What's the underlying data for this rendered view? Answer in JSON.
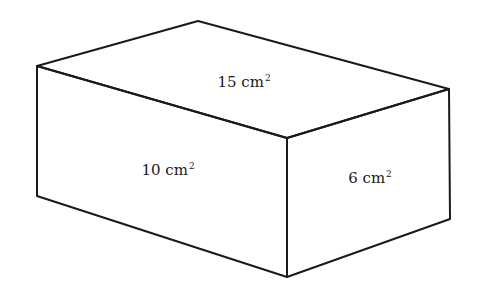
{
  "diagram": {
    "shape": "rectangular-prism",
    "stroke_color": "#1a1a1a",
    "background_color": "#ffffff",
    "vertices": {
      "top_back": [
        198,
        21
      ],
      "top_left": [
        37,
        66
      ],
      "top_right": [
        449,
        89
      ],
      "front_top": [
        287,
        138
      ],
      "bottom_left": [
        37,
        196
      ],
      "front_bottom": [
        287,
        277
      ],
      "bottom_right": [
        450,
        219
      ]
    },
    "faces": {
      "top": {
        "value": "15",
        "unit": "cm",
        "exponent": "2",
        "position": [
          244,
          82
        ]
      },
      "front": {
        "value": "10",
        "unit": "cm",
        "exponent": "2",
        "position": [
          168,
          170
        ]
      },
      "side": {
        "value": "6",
        "unit": "cm",
        "exponent": "2",
        "position": [
          370,
          178
        ]
      }
    }
  }
}
